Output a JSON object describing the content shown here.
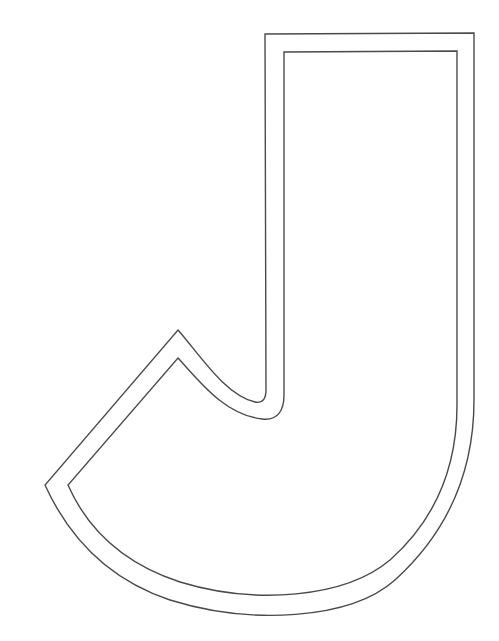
{
  "figure": {
    "letter": "J",
    "style": "double-outline",
    "colors": {
      "background": "#ffffff",
      "stroke": "#4a4a4a"
    }
  }
}
